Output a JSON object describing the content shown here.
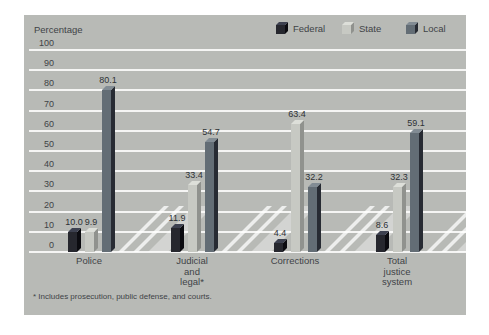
{
  "colors": {
    "panel_bg": "#b8bab6",
    "gridline": "rgba(255,255,255,0.85)",
    "floor_band_faint": "rgba(255,255,255,0.38)",
    "floor_band_bright": "rgba(255,255,255,0.75)",
    "text": "#3f4346"
  },
  "footnote": "* Includes prosecution, public defense, and courts.",
  "chart_data": {
    "type": "bar",
    "title": "",
    "xlabel": "",
    "ylabel": "Percentage",
    "ylim": [
      0,
      100
    ],
    "yticks": [
      0,
      10,
      20,
      30,
      40,
      50,
      60,
      70,
      80,
      90,
      100
    ],
    "grid": "horizontal-white",
    "legend_position": "top-right",
    "style": "3d-grouped-bars",
    "categories": [
      {
        "id": "police",
        "label_lines": [
          "Police"
        ]
      },
      {
        "id": "judicial-legal",
        "label_lines": [
          "Judicial",
          "and",
          "legal*"
        ]
      },
      {
        "id": "corrections",
        "label_lines": [
          "Corrections"
        ]
      },
      {
        "id": "total-justice",
        "label_lines": [
          "Total",
          "justice",
          "system"
        ]
      }
    ],
    "series": [
      {
        "name": "Federal",
        "values": [
          10.0,
          11.9,
          4.4,
          8.6
        ],
        "color_front": "#26272e",
        "color_side": "#0b0b10",
        "color_top": "#3d4150"
      },
      {
        "name": "State",
        "values": [
          9.9,
          33.4,
          63.4,
          32.3
        ],
        "color_front": "#c7c9c3",
        "color_side": "#90928e",
        "color_top": "#dddfd9"
      },
      {
        "name": "Local",
        "values": [
          80.1,
          54.7,
          32.2,
          59.1
        ],
        "color_front": "#636d75",
        "color_side": "#272b33",
        "color_top": "#828c94"
      }
    ]
  }
}
